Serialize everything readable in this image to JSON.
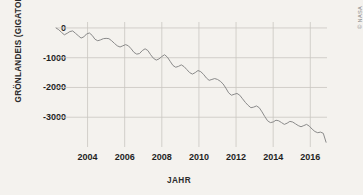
{
  "credit": "© NASA",
  "chart_data": {
    "type": "line",
    "title": "",
    "xlabel": "JAHR",
    "ylabel": "GRÖNLANDEIS (GIGATONNEN)",
    "xlim": [
      2002.3,
      2016.9
    ],
    "ylim": [
      -4000,
      200
    ],
    "grid": true,
    "legend": null,
    "xticks": [
      2004,
      2006,
      2008,
      2010,
      2012,
      2014,
      2016
    ],
    "xtick_labels": [
      "2004",
      "2006",
      "2008",
      "2010",
      "2012",
      "2014",
      "2016"
    ],
    "yticks": [
      0,
      -1000,
      -2000,
      -3000
    ],
    "ytick_labels": [
      "0",
      "-1000",
      "-2000",
      "-3000"
    ],
    "series": [
      {
        "name": "Grönlandeis Massenänderung",
        "color": "#8a8a8a",
        "x": [
          2002.3,
          2002.45,
          2002.6,
          2002.75,
          2002.9,
          2003.05,
          2003.2,
          2003.35,
          2003.5,
          2003.65,
          2003.8,
          2003.95,
          2004.1,
          2004.25,
          2004.4,
          2004.55,
          2004.7,
          2004.85,
          2005.0,
          2005.15,
          2005.3,
          2005.45,
          2005.6,
          2005.75,
          2005.9,
          2006.05,
          2006.2,
          2006.35,
          2006.5,
          2006.65,
          2006.8,
          2006.95,
          2007.1,
          2007.25,
          2007.4,
          2007.55,
          2007.7,
          2007.85,
          2008.0,
          2008.15,
          2008.3,
          2008.45,
          2008.6,
          2008.75,
          2008.9,
          2009.05,
          2009.2,
          2009.35,
          2009.5,
          2009.65,
          2009.8,
          2009.95,
          2010.1,
          2010.25,
          2010.4,
          2010.55,
          2010.7,
          2010.85,
          2011.0,
          2011.15,
          2011.3,
          2011.45,
          2011.6,
          2011.75,
          2011.9,
          2012.05,
          2012.2,
          2012.35,
          2012.5,
          2012.65,
          2012.8,
          2012.95,
          2013.1,
          2013.25,
          2013.4,
          2013.55,
          2013.7,
          2013.85,
          2014.0,
          2014.15,
          2014.3,
          2014.45,
          2014.6,
          2014.75,
          2014.9,
          2015.05,
          2015.2,
          2015.35,
          2015.5,
          2015.65,
          2015.8,
          2015.95,
          2016.1,
          2016.25,
          2016.4,
          2016.55,
          2016.7,
          2016.85
        ],
        "y": [
          0,
          -60,
          -150,
          -230,
          -180,
          -120,
          -100,
          -180,
          -260,
          -340,
          -300,
          -200,
          -170,
          -250,
          -380,
          -430,
          -400,
          -360,
          -350,
          -360,
          -430,
          -520,
          -600,
          -640,
          -600,
          -560,
          -600,
          -700,
          -820,
          -880,
          -860,
          -760,
          -700,
          -760,
          -900,
          -1020,
          -1080,
          -1040,
          -960,
          -900,
          -980,
          -1120,
          -1260,
          -1320,
          -1290,
          -1240,
          -1300,
          -1400,
          -1500,
          -1550,
          -1500,
          -1430,
          -1470,
          -1560,
          -1680,
          -1760,
          -1730,
          -1700,
          -1730,
          -1790,
          -1880,
          -2020,
          -2180,
          -2260,
          -2230,
          -2200,
          -2260,
          -2380,
          -2500,
          -2600,
          -2680,
          -2660,
          -2620,
          -2680,
          -2820,
          -2980,
          -3120,
          -3180,
          -3160,
          -3100,
          -3120,
          -3180,
          -3240,
          -3200,
          -3140,
          -3160,
          -3220,
          -3280,
          -3320,
          -3280,
          -3240,
          -3300,
          -3400,
          -3480,
          -3520,
          -3500,
          -3540,
          -3840
        ]
      }
    ]
  }
}
